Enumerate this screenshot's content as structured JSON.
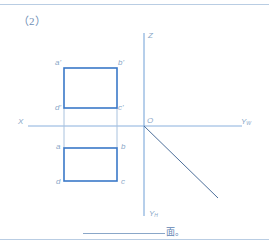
{
  "title": "（2）",
  "colors": {
    "frame": "#b9cde3",
    "axis": "#6f9fd6",
    "rect": "#3a78c8",
    "projection": "#a9c2de",
    "label": "#8aa7c8",
    "diagonal": "#4d6f9a"
  },
  "axes": {
    "x_label": "X",
    "z_label": "Z",
    "origin_label": "O",
    "yw_label": "Y",
    "yw_sub": "W",
    "yh_label": "Y",
    "yh_sub": "H"
  },
  "front_view": {
    "labels": {
      "a": "a'",
      "b": "b'",
      "c": "c'",
      "d": "d'"
    }
  },
  "top_view": {
    "labels": {
      "a": "a",
      "b": "b",
      "c": "c",
      "d": "d"
    }
  },
  "answer": {
    "blank": "",
    "suffix": "面。"
  }
}
